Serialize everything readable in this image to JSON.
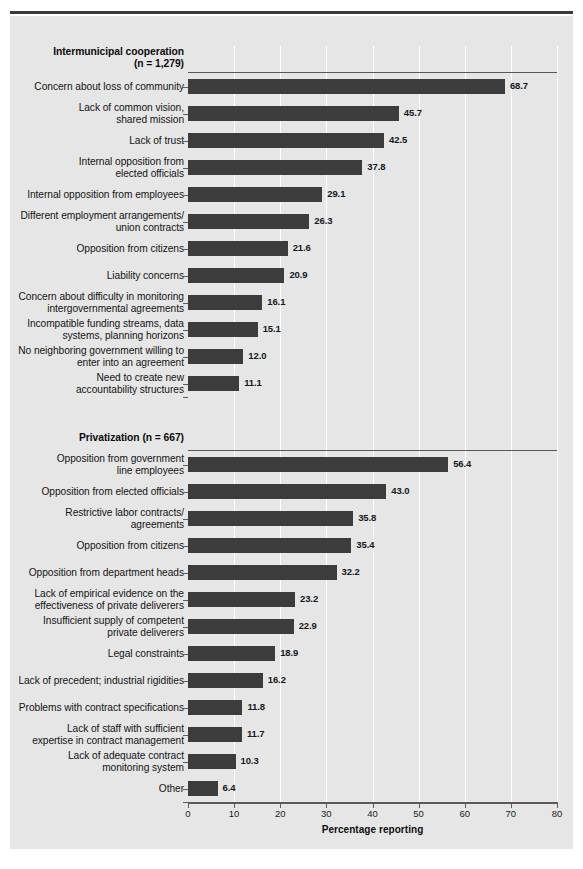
{
  "figure": {
    "background": "#e6e6e6",
    "bar_color": "#3c3c3c",
    "grid_color": "#ffffff",
    "axis_color": "#5a5a5a"
  },
  "axis": {
    "xlabel": "Percentage reporting",
    "xticks": [
      0,
      10,
      20,
      30,
      40,
      50,
      60,
      70,
      80
    ],
    "xlim": [
      0,
      80
    ]
  },
  "groups": [
    {
      "id": "intermunicipal",
      "header_line1": "Intermunicipal cooperation",
      "header_line2": "(n = 1,279)",
      "items": [
        {
          "label_lines": [
            "Concern about loss of community"
          ],
          "value": 68.7,
          "value_text": "68.7"
        },
        {
          "label_lines": [
            "Lack of common vision,",
            "shared mission"
          ],
          "value": 45.7,
          "value_text": "45.7"
        },
        {
          "label_lines": [
            "Lack of trust"
          ],
          "value": 42.5,
          "value_text": "42.5"
        },
        {
          "label_lines": [
            "Internal opposition from",
            "elected officials"
          ],
          "value": 37.8,
          "value_text": "37.8"
        },
        {
          "label_lines": [
            "Internal opposition from employees"
          ],
          "value": 29.1,
          "value_text": "29.1"
        },
        {
          "label_lines": [
            "Different employment arrangements/",
            "union contracts"
          ],
          "value": 26.3,
          "value_text": "26.3"
        },
        {
          "label_lines": [
            "Opposition from citizens"
          ],
          "value": 21.6,
          "value_text": "21.6"
        },
        {
          "label_lines": [
            "Liability concerns"
          ],
          "value": 20.9,
          "value_text": "20.9"
        },
        {
          "label_lines": [
            "Concern about difficulty in monitoring",
            "intergovernmental agreements"
          ],
          "value": 16.1,
          "value_text": "16.1"
        },
        {
          "label_lines": [
            "Incompatible funding streams, data",
            "systems, planning horizons"
          ],
          "value": 15.1,
          "value_text": "15.1"
        },
        {
          "label_lines": [
            "No neighboring government willing to",
            "enter into an agreement"
          ],
          "value": 12.0,
          "value_text": "12.0"
        },
        {
          "label_lines": [
            "Need to create new",
            "accountability structures"
          ],
          "value": 11.1,
          "value_text": "11.1"
        }
      ]
    },
    {
      "id": "privatization",
      "header_line1": "Privatization (n = 667)",
      "header_line2": "",
      "items": [
        {
          "label_lines": [
            "Opposition from government",
            "line employees"
          ],
          "value": 56.4,
          "value_text": "56.4"
        },
        {
          "label_lines": [
            "Opposition from elected officials"
          ],
          "value": 43.0,
          "value_text": "43.0"
        },
        {
          "label_lines": [
            "Restrictive labor contracts/",
            "agreements"
          ],
          "value": 35.8,
          "value_text": "35.8"
        },
        {
          "label_lines": [
            "Opposition from citizens"
          ],
          "value": 35.4,
          "value_text": "35.4"
        },
        {
          "label_lines": [
            "Opposition from department heads"
          ],
          "value": 32.2,
          "value_text": "32.2"
        },
        {
          "label_lines": [
            "Lack of empirical evidence on the",
            "effectiveness of private deliverers"
          ],
          "value": 23.2,
          "value_text": "23.2"
        },
        {
          "label_lines": [
            "Insufficient supply of competent",
            "private deliverers"
          ],
          "value": 22.9,
          "value_text": "22.9"
        },
        {
          "label_lines": [
            "Legal constraints"
          ],
          "value": 18.9,
          "value_text": "18.9"
        },
        {
          "label_lines": [
            "Lack of precedent; industrial rigidities"
          ],
          "value": 16.2,
          "value_text": "16.2"
        },
        {
          "label_lines": [
            "Problems with contract specifications"
          ],
          "value": 11.8,
          "value_text": "11.8"
        },
        {
          "label_lines": [
            "Lack of staff with sufficient",
            "expertise in contract management"
          ],
          "value": 11.7,
          "value_text": "11.7"
        },
        {
          "label_lines": [
            "Lack of adequate contract",
            "monitoring system"
          ],
          "value": 10.3,
          "value_text": "10.3"
        },
        {
          "label_lines": [
            "Other"
          ],
          "value": 6.4,
          "value_text": "6.4"
        }
      ]
    }
  ],
  "chart_data": {
    "type": "bar",
    "orientation": "horizontal",
    "title": "",
    "xlabel": "Percentage reporting",
    "ylabel": "",
    "xlim": [
      0,
      80
    ],
    "xticks": [
      0,
      10,
      20,
      30,
      40,
      50,
      60,
      70,
      80
    ],
    "grid": "vertical-white-gridlines",
    "legend": "none",
    "groups": [
      {
        "name": "Intermunicipal cooperation (n = 1,279)",
        "categories": [
          "Concern about loss of community",
          "Lack of common vision, shared mission",
          "Lack of trust",
          "Internal opposition from elected officials",
          "Internal opposition from employees",
          "Different employment arrangements/union contracts",
          "Opposition from citizens",
          "Liability concerns",
          "Concern about difficulty in monitoring intergovernmental agreements",
          "Incompatible funding streams, data systems, planning horizons",
          "No neighboring government willing to enter into an agreement",
          "Need to create new accountability structures"
        ],
        "values": [
          68.7,
          45.7,
          42.5,
          37.8,
          29.1,
          26.3,
          21.6,
          20.9,
          16.1,
          15.1,
          12.0,
          11.1
        ]
      },
      {
        "name": "Privatization (n = 667)",
        "categories": [
          "Opposition from government line employees",
          "Opposition from elected officials",
          "Restrictive labor contracts/agreements",
          "Opposition from citizens",
          "Opposition from department heads",
          "Lack of empirical evidence on the effectiveness of private deliverers",
          "Insufficient supply of competent private deliverers",
          "Legal constraints",
          "Lack of precedent; industrial rigidities",
          "Problems with contract specifications",
          "Lack of staff with sufficient expertise in contract management",
          "Lack of adequate contract monitoring system",
          "Other"
        ],
        "values": [
          56.4,
          43.0,
          35.8,
          35.4,
          32.2,
          23.2,
          22.9,
          18.9,
          16.2,
          11.8,
          11.7,
          10.3,
          6.4
        ]
      }
    ]
  }
}
